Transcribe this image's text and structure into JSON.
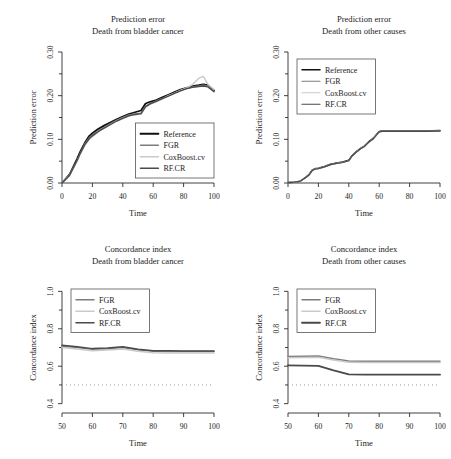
{
  "figure": {
    "name": "prediction-error-and-concordance-index-panels",
    "background": "#ffffff",
    "series_colors": {
      "Reference": "#101010",
      "FGR": "#7d7d7d",
      "CoxBoost.cv": "#c9c9c9",
      "RF.CR": "#4a4a4a"
    },
    "reference_dotted_color": "#9a9a9a"
  },
  "panels": [
    {
      "id": "top-left",
      "title_line1": "Prediction error",
      "title_line2": "Death from bladder cancer",
      "xlabel": "Time",
      "ylabel": "Prediction error",
      "legend_entries": [
        "Reference",
        "FGR",
        "CoxBoost.cv",
        "RF.CR"
      ]
    },
    {
      "id": "top-right",
      "title_line1": "Prediction error",
      "title_line2": "Death from other causes",
      "xlabel": "Time",
      "ylabel": "Prediction error",
      "legend_entries": [
        "Reference",
        "FGR",
        "CoxBoost.cv",
        "RF.CR"
      ]
    },
    {
      "id": "bottom-left",
      "title_line1": "Concordance index",
      "title_line2": "Death from bladder cancer",
      "xlabel": "Time",
      "ylabel": "Concordance index",
      "legend_entries": [
        "FGR",
        "CoxBoost.cv",
        "RF.CR"
      ]
    },
    {
      "id": "bottom-right",
      "title_line1": "Concordance index",
      "title_line2": "Death from other causes",
      "xlabel": "Time",
      "ylabel": "Concordance index",
      "legend_entries": [
        "FGR",
        "CoxBoost.cv",
        "RF.CR"
      ]
    }
  ],
  "chart_data": [
    {
      "panel": "top-left",
      "type": "line",
      "title": "Prediction error\nDeath from bladder cancer",
      "xlabel": "Time",
      "ylabel": "Prediction error",
      "xlim": [
        0,
        100
      ],
      "ylim": [
        0.0,
        0.3
      ],
      "xticks": [
        0,
        20,
        40,
        60,
        80,
        100
      ],
      "yticks": [
        0.0,
        0.1,
        0.2,
        0.3
      ],
      "ytick_labels": [
        "0.00",
        "0.10",
        "0.20",
        "0.30"
      ],
      "grid": false,
      "legend_position": "lower-right",
      "x": [
        0,
        5,
        10,
        12,
        15,
        18,
        20,
        24,
        28,
        32,
        36,
        40,
        44,
        48,
        52,
        55,
        58,
        62,
        66,
        70,
        74,
        78,
        82,
        86,
        90,
        93,
        96,
        100
      ],
      "series": [
        {
          "name": "Reference",
          "color": "#101010",
          "width": 1.8,
          "values": [
            0.0,
            0.02,
            0.056,
            0.072,
            0.092,
            0.108,
            0.114,
            0.124,
            0.132,
            0.139,
            0.146,
            0.152,
            0.158,
            0.162,
            0.166,
            0.182,
            0.186,
            0.19,
            0.196,
            0.202,
            0.208,
            0.214,
            0.218,
            0.222,
            0.224,
            0.226,
            0.224,
            0.212
          ]
        },
        {
          "name": "FGR",
          "color": "#7d7d7d",
          "width": 1.4,
          "values": [
            0.0,
            0.018,
            0.052,
            0.068,
            0.09,
            0.104,
            0.11,
            0.12,
            0.128,
            0.136,
            0.144,
            0.15,
            0.156,
            0.158,
            0.16,
            0.176,
            0.182,
            0.188,
            0.194,
            0.2,
            0.206,
            0.212,
            0.216,
            0.22,
            0.222,
            0.224,
            0.222,
            0.21
          ]
        },
        {
          "name": "CoxBoost.cv",
          "color": "#c9c9c9",
          "width": 1.4,
          "values": [
            0.0,
            0.018,
            0.05,
            0.066,
            0.086,
            0.1,
            0.106,
            0.118,
            0.126,
            0.134,
            0.142,
            0.148,
            0.154,
            0.156,
            0.158,
            0.174,
            0.18,
            0.186,
            0.192,
            0.2,
            0.206,
            0.212,
            0.218,
            0.226,
            0.24,
            0.244,
            0.226,
            0.214
          ]
        },
        {
          "name": "RF.CR",
          "color": "#4a4a4a",
          "width": 1.4,
          "values": [
            0.0,
            0.018,
            0.052,
            0.068,
            0.088,
            0.102,
            0.108,
            0.118,
            0.126,
            0.134,
            0.142,
            0.148,
            0.154,
            0.157,
            0.159,
            0.175,
            0.181,
            0.187,
            0.193,
            0.199,
            0.205,
            0.211,
            0.216,
            0.219,
            0.221,
            0.222,
            0.22,
            0.209
          ]
        }
      ]
    },
    {
      "panel": "top-right",
      "type": "line",
      "title": "Prediction error\nDeath from other causes",
      "xlabel": "Time",
      "ylabel": "Prediction error",
      "xlim": [
        0,
        100
      ],
      "ylim": [
        0.0,
        0.3
      ],
      "xticks": [
        0,
        20,
        40,
        60,
        80,
        100
      ],
      "yticks": [
        0.0,
        0.1,
        0.2,
        0.3
      ],
      "ytick_labels": [
        "0.00",
        "0.10",
        "0.20",
        "0.30"
      ],
      "grid": false,
      "legend_position": "upper-left",
      "x": [
        0,
        4,
        8,
        12,
        14,
        16,
        18,
        20,
        24,
        28,
        32,
        36,
        40,
        42,
        45,
        48,
        50,
        53,
        56,
        58,
        60,
        62,
        70,
        80,
        90,
        100
      ],
      "series": [
        {
          "name": "Reference",
          "color": "#101010",
          "width": 1.5,
          "values": [
            0.001,
            0.002,
            0.004,
            0.014,
            0.02,
            0.03,
            0.033,
            0.034,
            0.038,
            0.043,
            0.046,
            0.048,
            0.052,
            0.062,
            0.072,
            0.08,
            0.084,
            0.094,
            0.102,
            0.11,
            0.118,
            0.119,
            0.119,
            0.119,
            0.119,
            0.12
          ]
        },
        {
          "name": "FGR",
          "color": "#7d7d7d",
          "width": 1.2,
          "values": [
            0.001,
            0.002,
            0.004,
            0.013,
            0.019,
            0.029,
            0.032,
            0.033,
            0.037,
            0.042,
            0.045,
            0.047,
            0.051,
            0.061,
            0.071,
            0.079,
            0.083,
            0.093,
            0.101,
            0.109,
            0.117,
            0.118,
            0.118,
            0.118,
            0.118,
            0.119
          ]
        },
        {
          "name": "CoxBoost.cv",
          "color": "#c9c9c9",
          "width": 1.2,
          "values": [
            0.001,
            0.002,
            0.004,
            0.013,
            0.019,
            0.029,
            0.032,
            0.033,
            0.037,
            0.042,
            0.045,
            0.047,
            0.051,
            0.061,
            0.071,
            0.079,
            0.083,
            0.093,
            0.101,
            0.109,
            0.117,
            0.118,
            0.118,
            0.118,
            0.118,
            0.119
          ]
        },
        {
          "name": "RF.CR",
          "color": "#4a4a4a",
          "width": 1.2,
          "values": [
            0.001,
            0.002,
            0.004,
            0.013,
            0.019,
            0.029,
            0.032,
            0.033,
            0.037,
            0.042,
            0.045,
            0.047,
            0.051,
            0.061,
            0.071,
            0.079,
            0.083,
            0.093,
            0.101,
            0.109,
            0.117,
            0.118,
            0.118,
            0.118,
            0.118,
            0.119
          ]
        }
      ]
    },
    {
      "panel": "bottom-left",
      "type": "line",
      "title": "Concordance index\nDeath from bladder cancer",
      "xlabel": "Time",
      "ylabel": "Concordance index",
      "xlim": [
        50,
        100
      ],
      "ylim": [
        0.35,
        1.05
      ],
      "xticks": [
        50,
        60,
        70,
        80,
        90,
        100
      ],
      "yticks": [
        0.4,
        0.6,
        0.8,
        1.0
      ],
      "ytick_labels": [
        "0.4",
        "0.6",
        "0.8",
        "1.0"
      ],
      "grid": false,
      "legend_position": "upper-left",
      "reference_line": 0.5,
      "x": [
        50,
        55,
        60,
        65,
        70,
        75,
        80,
        85,
        90,
        95,
        100
      ],
      "series": [
        {
          "name": "FGR",
          "color": "#7d7d7d",
          "width": 1.5,
          "values": [
            0.707,
            0.7,
            0.69,
            0.693,
            0.7,
            0.688,
            0.68,
            0.679,
            0.678,
            0.678,
            0.678
          ]
        },
        {
          "name": "CoxBoost.cv",
          "color": "#c9c9c9",
          "width": 1.5,
          "values": [
            0.7,
            0.692,
            0.682,
            0.686,
            0.692,
            0.68,
            0.672,
            0.671,
            0.67,
            0.67,
            0.67
          ]
        },
        {
          "name": "RF.CR",
          "color": "#4a4a4a",
          "width": 1.5,
          "values": [
            0.712,
            0.704,
            0.694,
            0.697,
            0.704,
            0.691,
            0.683,
            0.682,
            0.681,
            0.681,
            0.681
          ]
        }
      ]
    },
    {
      "panel": "bottom-right",
      "type": "line",
      "title": "Concordance index\nDeath from other causes",
      "xlabel": "Time",
      "ylabel": "Concordance index",
      "xlim": [
        50,
        100
      ],
      "ylim": [
        0.35,
        1.05
      ],
      "xticks": [
        50,
        60,
        70,
        80,
        90,
        100
      ],
      "yticks": [
        0.4,
        0.6,
        0.8,
        1.0
      ],
      "ytick_labels": [
        "0.4",
        "0.6",
        "0.8",
        "1.0"
      ],
      "grid": false,
      "legend_position": "upper-left",
      "reference_line": 0.5,
      "x": [
        50,
        55,
        60,
        65,
        70,
        75,
        80,
        85,
        90,
        95,
        100
      ],
      "series": [
        {
          "name": "FGR",
          "color": "#7d7d7d",
          "width": 1.5,
          "values": [
            0.652,
            0.653,
            0.655,
            0.64,
            0.628,
            0.627,
            0.627,
            0.627,
            0.627,
            0.627,
            0.627
          ]
        },
        {
          "name": "CoxBoost.cv",
          "color": "#c9c9c9",
          "width": 1.5,
          "values": [
            0.645,
            0.646,
            0.648,
            0.633,
            0.621,
            0.62,
            0.62,
            0.62,
            0.62,
            0.62,
            0.62
          ]
        },
        {
          "name": "RF.CR",
          "color": "#4a4a4a",
          "width": 1.8,
          "values": [
            0.604,
            0.603,
            0.602,
            0.578,
            0.556,
            0.555,
            0.555,
            0.555,
            0.555,
            0.555,
            0.555
          ]
        }
      ]
    }
  ]
}
